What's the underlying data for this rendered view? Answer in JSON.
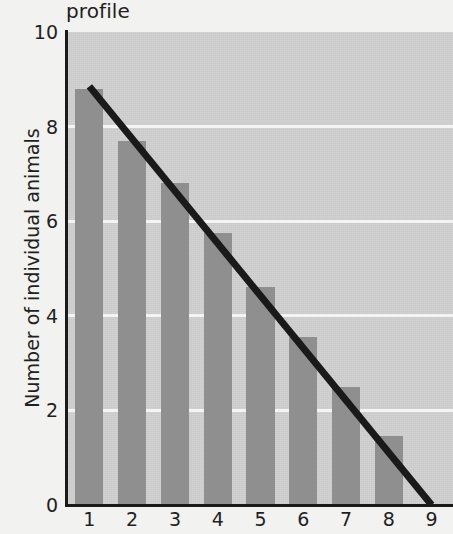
{
  "chart_data": {
    "type": "bar",
    "title": "profile",
    "xlabel": "",
    "ylabel": "Number of individual animals",
    "categories": [
      "1",
      "2",
      "3",
      "4",
      "5",
      "6",
      "7",
      "8",
      "9"
    ],
    "values": [
      8.8,
      7.7,
      6.8,
      5.75,
      4.6,
      3.55,
      2.5,
      1.45,
      0
    ],
    "ylim": [
      0,
      10
    ],
    "yticks": [
      "0",
      "2",
      "4",
      "6",
      "8",
      "10"
    ],
    "ytick_values": [
      0,
      2,
      4,
      6,
      8,
      10
    ],
    "gridlines": [
      2,
      4,
      6,
      8
    ],
    "grid": true,
    "legend": "none",
    "series": [
      {
        "name": "Number of individual animals",
        "type": "bar",
        "values": [
          8.8,
          7.7,
          6.8,
          5.75,
          4.6,
          3.55,
          2.5,
          1.45,
          0
        ],
        "color": "#8f8f8f"
      },
      {
        "name": "trend line",
        "type": "line",
        "points": [
          [
            1,
            8.85
          ],
          [
            9,
            0
          ]
        ],
        "color": "#1a1a1a"
      }
    ]
  },
  "colors": {
    "bar": "#8f8f8f",
    "plot_background": "#c9c9c9",
    "page_background": "#f2f2f0",
    "axis": "#1a1a1a",
    "gridline": "#f4f4f2",
    "trend_line": "#1a1a1a",
    "text": "#231f20"
  }
}
